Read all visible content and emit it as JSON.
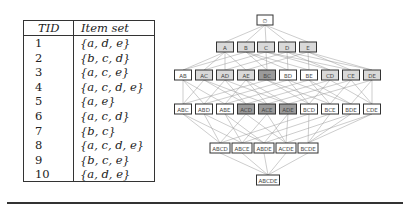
{
  "table": {
    "headers": {
      "tid": "TID",
      "itemset": "Item set"
    },
    "rows": [
      {
        "tid": "1",
        "itemset": "{a, d, e}"
      },
      {
        "tid": "2",
        "itemset": "{b, c, d}"
      },
      {
        "tid": "3",
        "itemset": "{a, c, e}"
      },
      {
        "tid": "4",
        "itemset": "{a, c, d, e}"
      },
      {
        "tid": "5",
        "itemset": "{a, e}"
      },
      {
        "tid": "6",
        "itemset": "{a, c, d}"
      },
      {
        "tid": "7",
        "itemset": "{b, c}"
      },
      {
        "tid": "8",
        "itemset": "{a, c, d, e}"
      },
      {
        "tid": "9",
        "itemset": "{b, c, e}"
      },
      {
        "tid": "10",
        "itemset": "{a, d, e}"
      }
    ]
  },
  "lattice": {
    "colors": {
      "white": "#ffffff",
      "light": "#d9d9d9",
      "dark": "#9a9a9a",
      "edge": "#9a9a9a"
    },
    "levels": [
      [
        {
          "label": "{}",
          "fill": "white"
        }
      ],
      [
        {
          "label": "A",
          "fill": "light"
        },
        {
          "label": "B",
          "fill": "light"
        },
        {
          "label": "C",
          "fill": "light"
        },
        {
          "label": "D",
          "fill": "light"
        },
        {
          "label": "E",
          "fill": "light"
        }
      ],
      [
        {
          "label": "AB",
          "fill": "white"
        },
        {
          "label": "AC",
          "fill": "light"
        },
        {
          "label": "AD",
          "fill": "light"
        },
        {
          "label": "AE",
          "fill": "light"
        },
        {
          "label": "BC",
          "fill": "dark"
        },
        {
          "label": "BD",
          "fill": "white"
        },
        {
          "label": "BE",
          "fill": "white"
        },
        {
          "label": "CD",
          "fill": "light"
        },
        {
          "label": "CE",
          "fill": "light"
        },
        {
          "label": "DE",
          "fill": "light"
        }
      ],
      [
        {
          "label": "ABC",
          "fill": "white"
        },
        {
          "label": "ABD",
          "fill": "white"
        },
        {
          "label": "ABE",
          "fill": "white"
        },
        {
          "label": "ACD",
          "fill": "dark"
        },
        {
          "label": "ACE",
          "fill": "dark"
        },
        {
          "label": "ADE",
          "fill": "dark"
        },
        {
          "label": "BCD",
          "fill": "white"
        },
        {
          "label": "BCE",
          "fill": "white"
        },
        {
          "label": "BDE",
          "fill": "white"
        },
        {
          "label": "CDE",
          "fill": "white"
        }
      ],
      [
        {
          "label": "ABCD",
          "fill": "white"
        },
        {
          "label": "ABCE",
          "fill": "white"
        },
        {
          "label": "ABDE",
          "fill": "white"
        },
        {
          "label": "ACDE",
          "fill": "white"
        },
        {
          "label": "BCDE",
          "fill": "white"
        }
      ],
      [
        {
          "label": "ABCDE",
          "fill": "white"
        }
      ]
    ]
  }
}
